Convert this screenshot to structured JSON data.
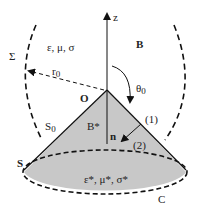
{
  "diagram": {
    "labels": {
      "sigma_surface": "Σ",
      "outer_medium": "ε, μ, σ",
      "r0": "r",
      "r0_sub": "0",
      "origin": "O",
      "z_axis": "z",
      "field_outside": "B",
      "theta": "θ",
      "theta_sub": "0",
      "s0": "S",
      "s0_sub": "0",
      "field_inside": "B*",
      "normal": "n",
      "side1": "(1)",
      "side2": "(2)",
      "inner_medium": "ε*, μ*, σ*",
      "apex_surface": "S",
      "curve_c": "C"
    },
    "colors": {
      "cone_fill": "#c8c8c8",
      "lines": "#111111"
    }
  }
}
